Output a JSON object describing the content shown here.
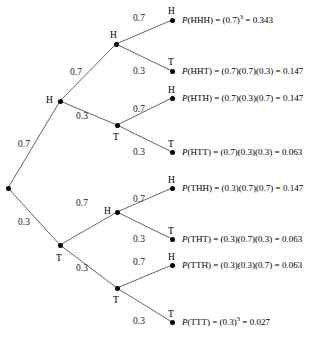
{
  "diagram": {
    "line_color": "#555555",
    "node_color": "#000000"
  },
  "root": {
    "name": "root-node",
    "x": 8,
    "y": 188
  },
  "level1": [
    {
      "name": "node-h",
      "label": "H",
      "x": 60,
      "y": 101,
      "label_x": 46,
      "label_y": 96,
      "weight": "0.7",
      "weight_x": 18,
      "weight_y": 140
    },
    {
      "name": "node-t",
      "label": "T",
      "x": 60,
      "y": 245,
      "label_x": 56,
      "label_y": 254,
      "weight": "0.3",
      "weight_x": 18,
      "weight_y": 218
    }
  ],
  "level2": [
    {
      "name": "node-hh",
      "label": "H",
      "x": 116,
      "y": 44,
      "label_x": 110,
      "label_y": 31,
      "weight": "0.7",
      "weight_x": 70,
      "weight_y": 68
    },
    {
      "name": "node-ht",
      "label": "T",
      "x": 117,
      "y": 125,
      "label_x": 113,
      "label_y": 133,
      "weight": "0.3",
      "weight_x": 76,
      "weight_y": 112
    },
    {
      "name": "node-th",
      "label": "H",
      "x": 117,
      "y": 212,
      "label_x": 104,
      "label_y": 207,
      "weight": "0.7",
      "weight_x": 76,
      "weight_y": 199
    },
    {
      "name": "node-tt",
      "label": "T",
      "x": 117,
      "y": 288,
      "label_x": 113,
      "label_y": 296,
      "weight": "0.3",
      "weight_x": 76,
      "weight_y": 264
    }
  ],
  "leaves": [
    {
      "name": "leaf-hhh",
      "label": "H",
      "x": 172,
      "y": 20,
      "label_x": 168,
      "label_y": 7,
      "weight": "0.7",
      "weight_x": 133,
      "weight_y": 14,
      "outcome": "HHH",
      "expression": "(0.7)",
      "exponent": "3",
      "factors": "",
      "result": "0.343",
      "text_x": 182,
      "text_y": 16
    },
    {
      "name": "leaf-hht",
      "label": "T",
      "x": 172,
      "y": 71,
      "label_x": 168,
      "label_y": 58,
      "weight": "0.3",
      "weight_x": 133,
      "weight_y": 67,
      "outcome": "HHT",
      "expression": "",
      "exponent": "",
      "factors": "(0.7)(0.7)(0.3)",
      "result": "0.147",
      "text_x": 182,
      "text_y": 67
    },
    {
      "name": "leaf-hth",
      "label": "H",
      "x": 172,
      "y": 98,
      "label_x": 168,
      "label_y": 86,
      "weight": "0.7",
      "weight_x": 133,
      "weight_y": 105,
      "outcome": "HTH",
      "expression": "",
      "exponent": "",
      "factors": "(0.7)(0.3)(0.7)",
      "result": "0.147",
      "text_x": 182,
      "text_y": 94
    },
    {
      "name": "leaf-htt",
      "label": "T",
      "x": 172,
      "y": 152,
      "label_x": 168,
      "label_y": 140,
      "weight": "0.3",
      "weight_x": 133,
      "weight_y": 148,
      "outcome": "HTT",
      "expression": "",
      "exponent": "",
      "factors": "(0.7)(0.3)(0.3)",
      "result": "0.063",
      "text_x": 182,
      "text_y": 148
    },
    {
      "name": "leaf-thh",
      "label": "H",
      "x": 172,
      "y": 188,
      "label_x": 168,
      "label_y": 176,
      "weight": "0.7",
      "weight_x": 133,
      "weight_y": 195,
      "outcome": "THH",
      "expression": "",
      "exponent": "",
      "factors": "(0.3)(0.7)(0.7)",
      "result": "0.147",
      "text_x": 182,
      "text_y": 184
    },
    {
      "name": "leaf-tht",
      "label": "T",
      "x": 172,
      "y": 239,
      "label_x": 168,
      "label_y": 227,
      "weight": "0.3",
      "weight_x": 133,
      "weight_y": 235,
      "outcome": "THT",
      "expression": "",
      "exponent": "",
      "factors": "(0.3)(0.7)(0.3)",
      "result": "0.063",
      "text_x": 182,
      "text_y": 235
    },
    {
      "name": "leaf-tth",
      "label": "H",
      "x": 172,
      "y": 265,
      "label_x": 168,
      "label_y": 253,
      "weight": "0.7",
      "weight_x": 133,
      "weight_y": 258,
      "outcome": "TTH",
      "expression": "",
      "exponent": "",
      "factors": "(0.3)(0.3)(0.7)",
      "result": "0.063",
      "text_x": 182,
      "text_y": 261
    },
    {
      "name": "leaf-ttt",
      "label": "T",
      "x": 172,
      "y": 322,
      "label_x": 168,
      "label_y": 310,
      "weight": "0.3",
      "weight_x": 133,
      "weight_y": 317,
      "outcome": "TTT",
      "expression": "(0.3)",
      "exponent": "3",
      "factors": "",
      "result": "0.027",
      "text_x": 182,
      "text_y": 318
    }
  ],
  "edges": [
    {
      "name": "edge-root-h",
      "x1": 8,
      "y1": 188,
      "x2": 60,
      "y2": 101
    },
    {
      "name": "edge-root-t",
      "x1": 8,
      "y1": 188,
      "x2": 60,
      "y2": 245
    },
    {
      "name": "edge-h-hh",
      "x1": 60,
      "y1": 101,
      "x2": 116,
      "y2": 44
    },
    {
      "name": "edge-h-ht",
      "x1": 60,
      "y1": 101,
      "x2": 117,
      "y2": 125
    },
    {
      "name": "edge-t-th",
      "x1": 60,
      "y1": 245,
      "x2": 117,
      "y2": 212
    },
    {
      "name": "edge-t-tt",
      "x1": 60,
      "y1": 245,
      "x2": 117,
      "y2": 288
    },
    {
      "name": "edge-hh-hhh",
      "x1": 116,
      "y1": 44,
      "x2": 172,
      "y2": 20
    },
    {
      "name": "edge-hh-hht",
      "x1": 116,
      "y1": 44,
      "x2": 172,
      "y2": 71
    },
    {
      "name": "edge-ht-hth",
      "x1": 117,
      "y1": 125,
      "x2": 172,
      "y2": 98
    },
    {
      "name": "edge-ht-htt",
      "x1": 117,
      "y1": 125,
      "x2": 172,
      "y2": 152
    },
    {
      "name": "edge-th-thh",
      "x1": 117,
      "y1": 212,
      "x2": 172,
      "y2": 188
    },
    {
      "name": "edge-th-tht",
      "x1": 117,
      "y1": 212,
      "x2": 172,
      "y2": 239
    },
    {
      "name": "edge-tt-tth",
      "x1": 117,
      "y1": 288,
      "x2": 172,
      "y2": 265
    },
    {
      "name": "edge-tt-ttt",
      "x1": 117,
      "y1": 288,
      "x2": 172,
      "y2": 322
    }
  ]
}
